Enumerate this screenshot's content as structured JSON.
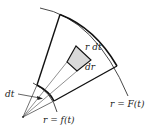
{
  "diagram": {
    "labels": {
      "area_element_width": "r dt",
      "area_element_height": "dr",
      "angle_increment": "dt",
      "inner_curve": "r = f(t)",
      "outer_curve": "r = F(t)"
    },
    "colors": {
      "line": "#1a1a1a",
      "shaded_element": "#d9d9d9",
      "background": "#ffffff"
    }
  }
}
